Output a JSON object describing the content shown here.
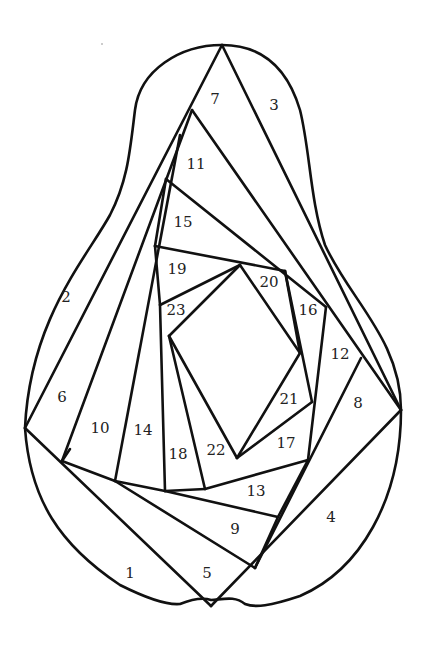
{
  "colors": {
    "line": "#111111",
    "label": "#222222",
    "background": "#ffffff"
  },
  "outline": "M222,45 C180,45 140,70 135,110 C130,150 128,180 110,215 C85,260 30,320 25,428 C30,500 60,545 120,585 C150,600 170,605 180,604 C195,598 205,598 211,600 C225,599 235,596 245,604 C255,608 270,606 300,596 C360,570 401,500 401,410 C401,340 350,300 325,245 C310,200 310,150 300,110 C285,60 255,45 222,45 Z",
  "segments": [
    [
      222,
      45,
      25,
      428
    ],
    [
      222,
      45,
      401,
      410
    ],
    [
      192,
      110,
      401,
      410
    ],
    [
      25,
      428,
      211,
      606
    ],
    [
      211,
      606,
      401,
      410
    ],
    [
      192,
      110,
      62,
      461
    ],
    [
      180,
      135,
      115,
      481
    ],
    [
      166,
      179,
      326,
      307
    ],
    [
      166,
      179,
      155,
      246
    ],
    [
      155,
      246,
      160,
      305
    ],
    [
      155,
      246,
      285,
      271
    ],
    [
      285,
      271,
      300,
      353
    ],
    [
      160,
      305,
      240,
      265
    ],
    [
      169,
      336,
      240,
      265
    ],
    [
      240,
      265,
      300,
      353
    ],
    [
      300,
      353,
      237,
      458
    ],
    [
      160,
      305,
      165,
      491
    ],
    [
      169,
      336,
      237,
      458
    ],
    [
      169,
      336,
      205,
      489
    ],
    [
      285,
      271,
      312,
      402
    ],
    [
      312,
      402,
      237,
      458
    ],
    [
      326,
      307,
      308,
      460
    ],
    [
      308,
      460,
      205,
      489
    ],
    [
      205,
      489,
      165,
      491
    ],
    [
      165,
      491,
      278,
      517
    ],
    [
      115,
      481,
      165,
      491
    ],
    [
      62,
      461,
      115,
      481
    ],
    [
      115,
      481,
      255,
      568
    ],
    [
      278,
      517,
      255,
      568
    ],
    [
      308,
      460,
      278,
      517
    ],
    [
      361,
      358,
      255,
      568
    ],
    [
      62,
      461,
      70,
      449
    ]
  ],
  "labels": [
    {
      "id": "1",
      "x": 130,
      "y": 574
    },
    {
      "id": "2",
      "x": 66,
      "y": 298
    },
    {
      "id": "3",
      "x": 274,
      "y": 106
    },
    {
      "id": "4",
      "x": 331,
      "y": 518
    },
    {
      "id": "5",
      "x": 207,
      "y": 574
    },
    {
      "id": "6",
      "x": 62,
      "y": 398
    },
    {
      "id": "7",
      "x": 215,
      "y": 100
    },
    {
      "id": "8",
      "x": 358,
      "y": 404
    },
    {
      "id": "9",
      "x": 235,
      "y": 530
    },
    {
      "id": "10",
      "x": 100,
      "y": 429
    },
    {
      "id": "11",
      "x": 196,
      "y": 165
    },
    {
      "id": "12",
      "x": 340,
      "y": 355
    },
    {
      "id": "13",
      "x": 256,
      "y": 492
    },
    {
      "id": "14",
      "x": 143,
      "y": 431
    },
    {
      "id": "15",
      "x": 183,
      "y": 223
    },
    {
      "id": "16",
      "x": 308,
      "y": 311
    },
    {
      "id": "17",
      "x": 286,
      "y": 444
    },
    {
      "id": "18",
      "x": 178,
      "y": 455
    },
    {
      "id": "19",
      "x": 177,
      "y": 270
    },
    {
      "id": "20",
      "x": 269,
      "y": 283
    },
    {
      "id": "21",
      "x": 289,
      "y": 400
    },
    {
      "id": "22",
      "x": 216,
      "y": 451
    },
    {
      "id": "23",
      "x": 176,
      "y": 311
    }
  ]
}
